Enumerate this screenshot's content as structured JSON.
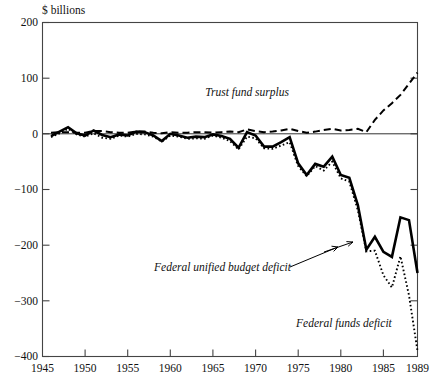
{
  "chart_data": {
    "type": "line",
    "title": "",
    "ylabel": "$ billions",
    "xlabel": "",
    "xlim": [
      1945,
      1989
    ],
    "ylim": [
      -400,
      200
    ],
    "grid": false,
    "legend_position": "inline-annotations",
    "ytick_labels": [
      "200",
      "100",
      "0",
      "−100",
      "−200",
      "−300",
      "−400"
    ],
    "ytick_values": [
      200,
      100,
      0,
      -100,
      -200,
      -300,
      -400
    ],
    "xtick_labels": [
      "1945",
      "1950",
      "1955",
      "1960",
      "1965",
      "1970",
      "1975",
      "1980",
      "1985",
      "1989"
    ],
    "xtick_values": [
      1945,
      1950,
      1955,
      1960,
      1965,
      1970,
      1975,
      1980,
      1985,
      1989
    ],
    "annotations": [
      {
        "name": "trust-fund-surplus-label",
        "text": "Trust fund surplus",
        "x": 1979.5,
        "y": 90
      },
      {
        "name": "federal-unified-budget-deficit-label",
        "text": "Federal unified budget deficit",
        "x": 1965.0,
        "y": -262
      },
      {
        "name": "federal-funds-deficit-label",
        "text": "Federal funds deficit",
        "x": 1976.5,
        "y": -327
      }
    ],
    "x": [
      1946,
      1947,
      1948,
      1949,
      1950,
      1951,
      1952,
      1953,
      1954,
      1955,
      1956,
      1957,
      1958,
      1959,
      1960,
      1961,
      1962,
      1963,
      1964,
      1965,
      1966,
      1967,
      1968,
      1969,
      1970,
      1971,
      1972,
      1973,
      1974,
      1975,
      1976,
      1977,
      1978,
      1979,
      1980,
      1981,
      1982,
      1983,
      1984,
      1985,
      1986,
      1987,
      1988,
      1989
    ],
    "series": [
      {
        "name": "Federal unified budget deficit",
        "style": "solid-thick",
        "values": [
          -4,
          4,
          12,
          1,
          -3,
          6,
          -2,
          -6,
          -1,
          -3,
          4,
          3,
          -3,
          -13,
          0,
          -3,
          -7,
          -5,
          -6,
          -1,
          -4,
          -9,
          -25,
          3,
          -3,
          -23,
          -23,
          -15,
          -6,
          -53,
          -74,
          -54,
          -59,
          -41,
          -74,
          -79,
          -128,
          -208,
          -185,
          -212,
          -221,
          -150,
          -155,
          -250
        ]
      },
      {
        "name": "Trust fund surplus",
        "style": "dashed",
        "values": [
          2,
          3,
          3,
          2,
          2,
          5,
          5,
          3,
          2,
          2,
          4,
          4,
          2,
          1,
          3,
          2,
          2,
          3,
          3,
          2,
          3,
          4,
          3,
          8,
          5,
          3,
          4,
          6,
          9,
          5,
          2,
          4,
          7,
          9,
          6,
          7,
          9,
          3,
          25,
          42,
          55,
          70,
          90,
          110
        ]
      },
      {
        "name": "Federal funds deficit",
        "style": "dotted",
        "values": [
          -6,
          1,
          9,
          -1,
          -5,
          1,
          -7,
          -9,
          -3,
          -5,
          0,
          -1,
          -5,
          -14,
          -3,
          -5,
          -9,
          -8,
          -9,
          -3,
          -7,
          -13,
          -28,
          -5,
          -8,
          -26,
          -27,
          -21,
          -15,
          -58,
          -76,
          -58,
          -66,
          -50,
          -80,
          -86,
          -137,
          -211,
          -210,
          -254,
          -276,
          -220,
          -290,
          -390
        ]
      }
    ]
  }
}
